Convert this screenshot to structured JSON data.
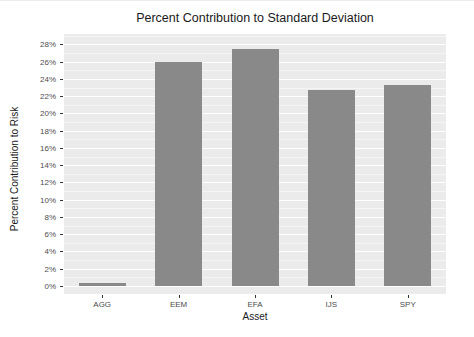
{
  "figure": {
    "background": "#ffffff"
  },
  "chart_data": {
    "type": "bar",
    "title": "Percent Contribution to Standard Deviation",
    "xlabel": "Asset",
    "ylabel": "Percent Contribution to Risk",
    "categories": [
      "AGG",
      "EEM",
      "EFA",
      "IJS",
      "SPY"
    ],
    "values": [
      0.4,
      26.0,
      27.5,
      22.7,
      23.3
    ],
    "unit": "%",
    "ylim": [
      0,
      29
    ],
    "y_major_ticks": [
      0,
      2,
      4,
      6,
      8,
      10,
      12,
      14,
      16,
      18,
      20,
      22,
      24,
      26,
      28
    ],
    "y_tick_labels": [
      "0%",
      "2%",
      "4%",
      "6%",
      "8%",
      "10%",
      "12%",
      "14%",
      "16%",
      "18%",
      "20%",
      "22%",
      "24%",
      "26%",
      "28%"
    ],
    "y_minor_step": 1,
    "grid": "horizontal-major-and-minor",
    "legend": "none",
    "colors": {
      "bar_fill": "#898989",
      "panel_bg": "#ebebeb",
      "grid_major": "#ffffff",
      "grid_minor": "#f5f5f5",
      "axis_text": "#4d4d4d",
      "title_text": "#1a1a1a",
      "tick_mark": "#333333"
    }
  }
}
